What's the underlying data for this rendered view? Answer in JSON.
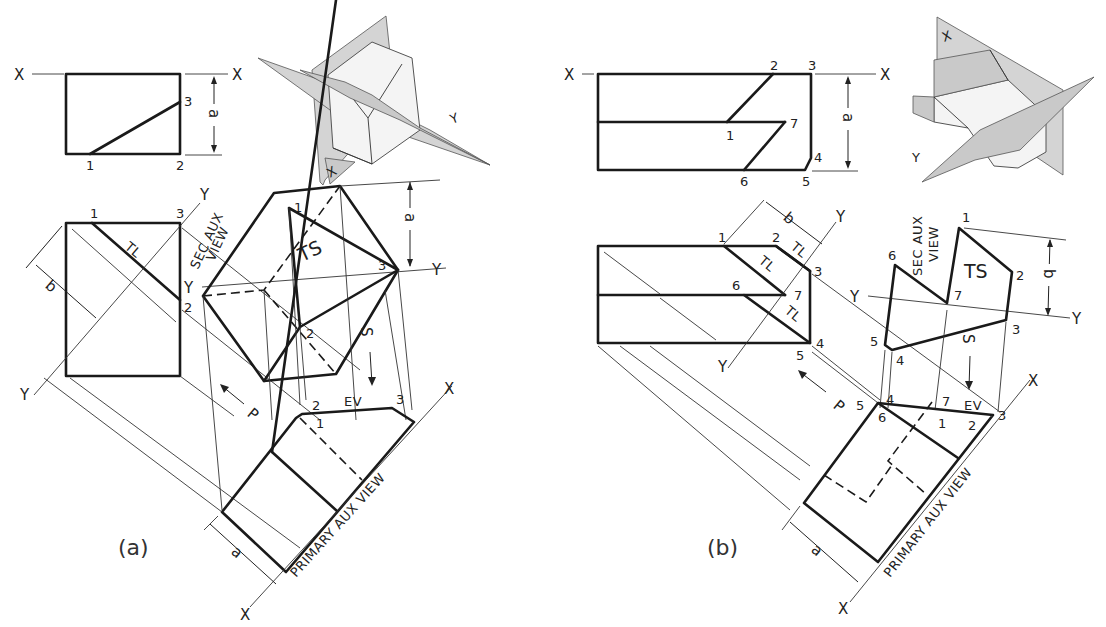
{
  "figure": {
    "panels": [
      {
        "caption": "(a)",
        "fold_lines": {
          "x_left": "X",
          "x_right": "X",
          "y_top": "Y",
          "y_bottom": "Y",
          "y_sec_left": "Y",
          "y_sec_right": "Y",
          "x_aux_top": "X",
          "x_aux_bottom": "X"
        },
        "front_view_points": [
          "1",
          "2",
          "3"
        ],
        "top_view_points": [
          "1",
          "3",
          "2"
        ],
        "dimensions": {
          "a_front": "a",
          "b_top": "b",
          "a_sec": "a",
          "a_primary": "a"
        },
        "annotations": {
          "tl": "TL",
          "ts": "TS",
          "ev": "EV",
          "p_arrow": "P",
          "s_arrow": "S"
        },
        "sec_aux_points": [
          "1",
          "3",
          "2"
        ],
        "primary_aux_points": [
          "2",
          "1",
          "3"
        ],
        "view_labels": {
          "sec_aux_line1": "SEC AUX",
          "sec_aux_line2": "VIEW",
          "primary_aux": "PRIMARY AUX VIEW"
        },
        "pictorial_labels": {
          "x": "X",
          "y": "Y"
        }
      },
      {
        "caption": "(b)",
        "fold_lines": {
          "x_left": "X",
          "x_right": "X",
          "y_top": "Y",
          "y_bottom": "Y",
          "y_sec_left": "Y",
          "y_sec_right": "Y",
          "x_aux_top": "X",
          "x_aux_bottom": "X"
        },
        "front_view_points": [
          "2",
          "3",
          "1",
          "7",
          "4",
          "6",
          "5"
        ],
        "top_view_points": [
          "1",
          "2",
          "3",
          "6",
          "7",
          "5",
          "4"
        ],
        "dimensions": {
          "a_front": "a",
          "b_top": "b",
          "b_sec": "b",
          "a_primary": "a"
        },
        "annotations": {
          "tl1": "TL",
          "tl2": "TL",
          "tl3": "TL",
          "ts": "TS",
          "ev": "EV",
          "p_arrow": "P",
          "s_arrow": "S"
        },
        "sec_aux_points": [
          "1",
          "2",
          "3",
          "4",
          "5",
          "6",
          "7"
        ],
        "primary_aux_points": [
          "5",
          "4",
          "6",
          "7",
          "1",
          "2",
          "3"
        ],
        "view_labels": {
          "sec_aux_line1": "SEC AUX",
          "sec_aux_line2": "VIEW",
          "primary_aux": "PRIMARY AUX VIEW"
        },
        "pictorial_labels": {
          "x": "X",
          "y": "Y"
        }
      }
    ]
  }
}
